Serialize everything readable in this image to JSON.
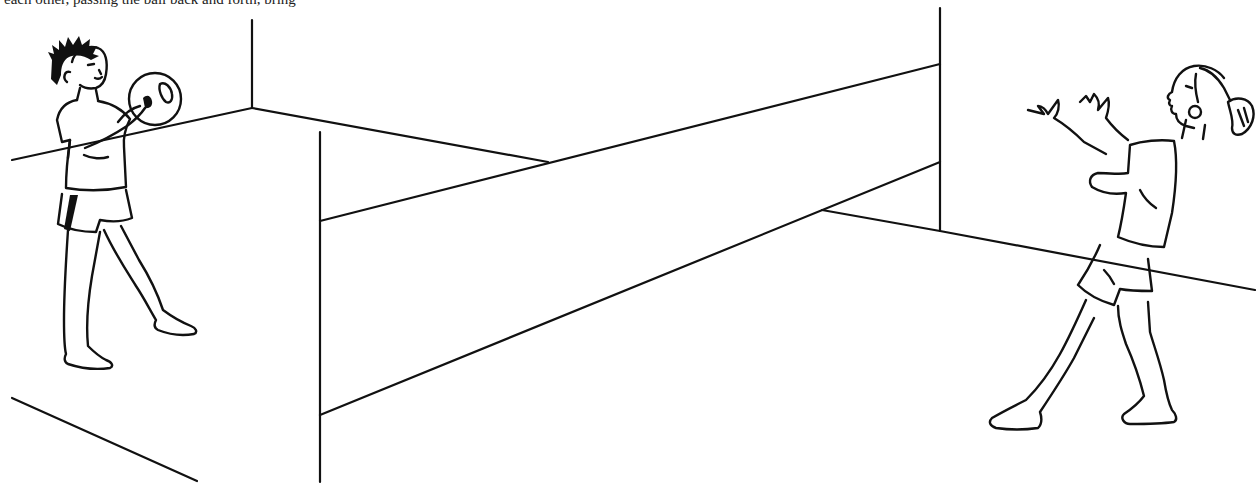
{
  "caption": {
    "text": "each other, passing the ball back and forth, bring"
  },
  "illustration": {
    "description": "Line drawing of two children tossing a ball over a low net between two walls",
    "ink_color": "#111111",
    "background_color": "#ffffff",
    "figures": [
      {
        "name": "boy-with-ball",
        "pose": "holding ball, ready to throw"
      },
      {
        "name": "girl-catching",
        "pose": "arms raised ready to catch"
      }
    ]
  }
}
